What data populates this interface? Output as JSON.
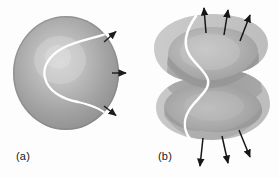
{
  "figure": {
    "kind": "physics-diagram",
    "background_color": "#fdfdfd",
    "panels": [
      {
        "id": "a",
        "label": "(a)",
        "label_x": 16,
        "label_y": 150,
        "caption_text": "(a)",
        "sphere": {
          "center_x": 66,
          "center_y": 73,
          "radius_x": 53,
          "radius_y": 57,
          "fill_light": "#c9c9c9",
          "fill_mid": "#9a9a9a",
          "fill_dark": "#7e7e7e",
          "highlight_x": 60,
          "highlight_y": 62
        },
        "nodal_curve_color": "#ffffff",
        "nodal_curve_width": 2.2,
        "arrows": [
          {
            "name": "arrow-upper-right",
            "x1": 104,
            "y1": 42,
            "x2": 117,
            "y2": 31,
            "color": "#1c1c1c"
          },
          {
            "name": "arrow-middle-right",
            "x1": 112,
            "y1": 73,
            "x2": 127,
            "y2": 73,
            "color": "#1c1c1c"
          },
          {
            "name": "arrow-lower-right",
            "x1": 104,
            "y1": 106,
            "x2": 117,
            "y2": 116,
            "color": "#1c1c1c"
          }
        ]
      },
      {
        "id": "b",
        "label": "(b)",
        "label_x": 158,
        "label_y": 150,
        "caption_text": "(b)",
        "shape": {
          "center_x": 212,
          "center_y": 88,
          "outer_fill": "#c4c4c4",
          "inner_fill_light": "#b6b6b6",
          "inner_fill_mid": "#9d9d9d",
          "inner_fill_dark": "#8a8a8a"
        },
        "nodal_curve_color": "#ffffff",
        "nodal_curve_width": 2.4,
        "arrows": [
          {
            "name": "arrow-top-left",
            "x1": 206,
            "y1": 34,
            "x2": 204,
            "y2": 6,
            "color": "#161616"
          },
          {
            "name": "arrow-top-center",
            "x1": 224,
            "y1": 36,
            "x2": 228,
            "y2": 8,
            "color": "#161616"
          },
          {
            "name": "arrow-top-right",
            "x1": 240,
            "y1": 42,
            "x2": 250,
            "y2": 13,
            "color": "#161616"
          },
          {
            "name": "arrow-bottom-left",
            "x1": 203,
            "y1": 138,
            "x2": 200,
            "y2": 169,
            "color": "#161616"
          },
          {
            "name": "arrow-bottom-center",
            "x1": 222,
            "y1": 136,
            "x2": 228,
            "y2": 166,
            "color": "#161616"
          },
          {
            "name": "arrow-bottom-right",
            "x1": 239,
            "y1": 130,
            "x2": 250,
            "y2": 160,
            "color": "#161616"
          }
        ]
      }
    ]
  }
}
